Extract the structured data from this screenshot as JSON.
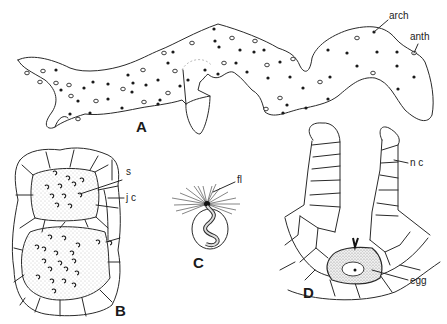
{
  "figure": {
    "panels": [
      {
        "id": "A",
        "label": "A",
        "description": "thalloid gametophyte with scattered sex organs",
        "annotations": [
          {
            "text": "arch",
            "target": "archegonium"
          },
          {
            "text": "anth",
            "target": "antheridium"
          }
        ]
      },
      {
        "id": "B",
        "label": "B",
        "description": "antheridia in section with jacket cells and sperm",
        "annotations": [
          {
            "text": "s",
            "target": "sperm"
          },
          {
            "text": "j c",
            "target": "jacket cell"
          }
        ]
      },
      {
        "id": "C",
        "label": "C",
        "description": "multiflagellate sperm",
        "annotations": [
          {
            "text": "fl",
            "target": "flagella"
          }
        ]
      },
      {
        "id": "D",
        "label": "D",
        "description": "archegonium in longitudinal section",
        "annotations": [
          {
            "text": "n c",
            "target": "neck canal"
          },
          {
            "text": "egg",
            "target": "egg cell"
          }
        ]
      }
    ],
    "colors": {
      "ink": "#2a2a2a",
      "background": "#ffffff",
      "stipple": "#9a9a9a"
    }
  }
}
